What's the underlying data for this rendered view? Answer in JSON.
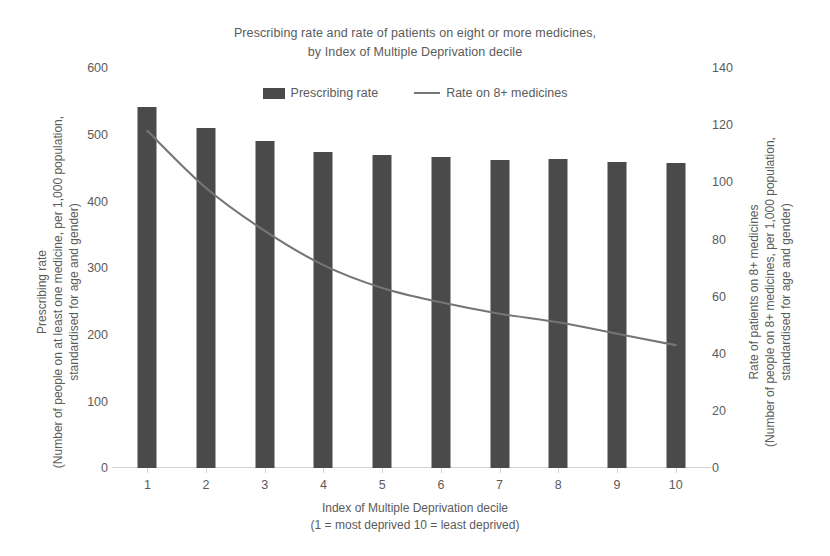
{
  "title": {
    "line1": "Prescribing rate and rate of patients on eight or more medicines,",
    "line2": "by Index of Multiple Deprivation decile"
  },
  "legend": {
    "items": [
      {
        "label": "Prescribing rate",
        "marker": "bar-swatch",
        "color": "#4a4a4a"
      },
      {
        "label": "Rate on 8+ medicines",
        "marker": "line-swatch",
        "color": "#757575"
      }
    ]
  },
  "axes": {
    "left": {
      "title_line1": "Prescribing rate",
      "title_line2": "(Number of people on at least one medicine, per 1,000 population,",
      "title_line3": "standardised for age and gender)",
      "ticks": [
        "0",
        "100",
        "200",
        "300",
        "400",
        "500",
        "600"
      ]
    },
    "right": {
      "title_line1": "Rate of patients on 8+ medicines",
      "title_line2": "(Number of people on 8+ medicines, per 1,000 population,",
      "title_line3": "standardised for age and gender)",
      "ticks": [
        "0",
        "20",
        "40",
        "60",
        "80",
        "100",
        "120",
        "140"
      ]
    },
    "x": {
      "title_line1": "Index of Multiple Deprivation decile",
      "title_line2": "(1 = most deprived 10 = least deprived)",
      "ticks": [
        "1",
        "2",
        "3",
        "4",
        "5",
        "6",
        "7",
        "8",
        "9",
        "10"
      ]
    }
  },
  "chart_data": {
    "type": "bar",
    "title": "Prescribing rate and rate of patients on eight or more medicines, by Index of Multiple Deprivation decile",
    "xlabel": "Index of Multiple Deprivation decile (1 = most deprived 10 = least deprived)",
    "ylabel": "Prescribing rate (Number of people on at least one medicine, per 1,000 population, standardised for age and gender)",
    "y2label": "Rate of patients on 8+ medicines (Number of people on 8+ medicines, per 1,000 population, standardised for age and gender)",
    "categories": [
      "1",
      "2",
      "3",
      "4",
      "5",
      "6",
      "7",
      "8",
      "9",
      "10"
    ],
    "ylim": [
      0,
      600
    ],
    "y2lim": [
      0,
      140
    ],
    "yticks": [
      0,
      100,
      200,
      300,
      400,
      500,
      600
    ],
    "y2ticks": [
      0,
      20,
      40,
      60,
      80,
      100,
      120,
      140
    ],
    "grid": false,
    "legend_position": "top-center",
    "series": [
      {
        "name": "Prescribing rate",
        "type": "bar",
        "axis": "left",
        "color": "#4a4a4a",
        "values": [
          541,
          510,
          490,
          474,
          470,
          466,
          462,
          464,
          459,
          457
        ]
      },
      {
        "name": "Rate on 8+ medicines",
        "type": "line",
        "axis": "right",
        "color": "#757575",
        "values": [
          118,
          98,
          83,
          71,
          63,
          58,
          54,
          51,
          47,
          43
        ]
      }
    ]
  }
}
